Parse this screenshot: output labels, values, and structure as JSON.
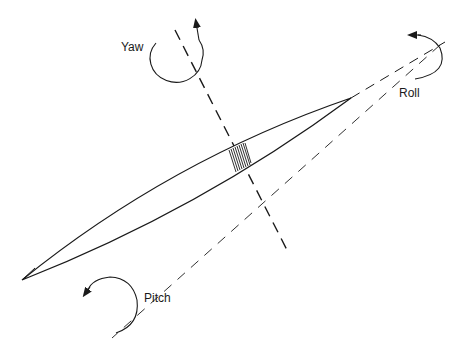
{
  "diagram": {
    "type": "aircraft rotation axes",
    "colors": {
      "stroke": "#1a1a1a",
      "background": "#ffffff"
    },
    "labels": {
      "yaw": "Yaw",
      "roll": "Roll",
      "pitch": "Pitch"
    },
    "axes": [
      {
        "name": "yaw-axis",
        "style": "dashed",
        "from": [
          175,
          30
        ],
        "to": [
          288,
          252
        ]
      },
      {
        "name": "roll-axis",
        "style": "dashed",
        "from": [
          350,
          98
        ],
        "to": [
          440,
          45
        ]
      },
      {
        "name": "pitch-axis",
        "style": "dashed",
        "from": [
          440,
          45
        ],
        "to": [
          112,
          338
        ]
      }
    ],
    "body": {
      "shape": "elongated lens",
      "tip_left": [
        22,
        280
      ],
      "tip_right": [
        351,
        98
      ]
    },
    "rotation_arrows": [
      "yaw",
      "roll",
      "pitch"
    ]
  }
}
